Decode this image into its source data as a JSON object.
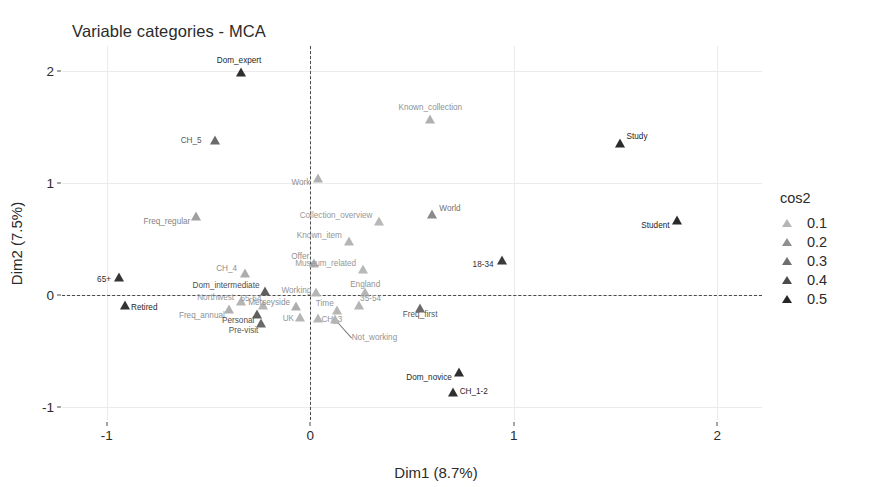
{
  "chart_data": {
    "type": "scatter",
    "title": "Variable categories - MCA",
    "xlabel": "Dim1 (8.7%)",
    "ylabel": "Dim2 (7.5%)",
    "xlim": [
      -1.22,
      2.22
    ],
    "ylim": [
      -1.12,
      2.22
    ],
    "xticks": [
      -1,
      0,
      1,
      2
    ],
    "xtick_labels": [
      "-1",
      "0",
      "1",
      "2"
    ],
    "yticks": [
      -1,
      0,
      1,
      2
    ],
    "ytick_labels": [
      "-1",
      "0",
      "1",
      "2"
    ],
    "grid": true,
    "reference_lines": {
      "x": 0,
      "y": 0,
      "style": "dashed"
    },
    "legend": {
      "title": "cos2",
      "position": "right",
      "entries": [
        {
          "label": "0.1",
          "color": "#b5b5b5"
        },
        {
          "label": "0.2",
          "color": "#909090"
        },
        {
          "label": "0.3",
          "color": "#6e6e6e"
        },
        {
          "label": "0.4",
          "color": "#4b4b4b"
        },
        {
          "label": "0.5",
          "color": "#262626"
        }
      ]
    },
    "color_variable": "cos2",
    "points": [
      {
        "label": "Dom_expert",
        "x": -0.34,
        "y": 1.99,
        "cos2": 0.46,
        "color": "#2f2f2f",
        "lx": -2,
        "ly": -11,
        "anchor": "middle"
      },
      {
        "label": "Known_collection",
        "x": 0.59,
        "y": 1.57,
        "cos2": 0.13,
        "color": "#b0b0b0",
        "lx": 0,
        "ly": -11,
        "anchor": "middle"
      },
      {
        "label": "CH_5",
        "x": -0.47,
        "y": 1.38,
        "cos2": 0.3,
        "color": "#6a6a6a",
        "lx": -13,
        "ly": 1,
        "anchor": "end"
      },
      {
        "label": "Study",
        "x": 1.52,
        "y": 1.35,
        "cos2": 0.47,
        "color": "#2b2b2b",
        "lx": 7,
        "ly": -6,
        "anchor": "start"
      },
      {
        "label": "Work",
        "x": 0.04,
        "y": 1.04,
        "cos2": 0.13,
        "color": "#b0b0b0",
        "lx": -8,
        "ly": 5,
        "anchor": "end"
      },
      {
        "label": "Freq_regular",
        "x": -0.56,
        "y": 0.7,
        "cos2": 0.17,
        "color": "#a0a0a0",
        "lx": -6,
        "ly": 6,
        "anchor": "end"
      },
      {
        "label": "World",
        "x": 0.6,
        "y": 0.72,
        "cos2": 0.22,
        "color": "#8a8a8a",
        "lx": 7,
        "ly": -5,
        "anchor": "start"
      },
      {
        "label": "Collection_overview",
        "x": 0.34,
        "y": 0.66,
        "cos2": 0.11,
        "color": "#b8b8b8",
        "lx": -7,
        "ly": -5,
        "anchor": "end"
      },
      {
        "label": "Student",
        "x": 1.8,
        "y": 0.67,
        "cos2": 0.48,
        "color": "#2b2b2b",
        "lx": -7,
        "ly": 6,
        "anchor": "end"
      },
      {
        "label": "Known_item",
        "x": 0.19,
        "y": 0.48,
        "cos2": 0.12,
        "color": "#b5b5b5",
        "lx": -7,
        "ly": -5,
        "anchor": "end"
      },
      {
        "label": "18-34",
        "x": 0.94,
        "y": 0.31,
        "cos2": 0.41,
        "color": "#3a3a3a",
        "lx": -8,
        "ly": 5,
        "anchor": "end"
      },
      {
        "label": "Offer",
        "x": 0.02,
        "y": 0.28,
        "cos2": 0.13,
        "color": "#b0b0b0",
        "lx": -5,
        "ly": -6,
        "anchor": "end"
      },
      {
        "label": "Museum_related",
        "x": 0.26,
        "y": 0.23,
        "cos2": 0.11,
        "color": "#b8b8b8",
        "lx": -7,
        "ly": -5,
        "anchor": "end"
      },
      {
        "label": "CH_4",
        "x": -0.32,
        "y": 0.19,
        "cos2": 0.14,
        "color": "#adadad",
        "lx": -8,
        "ly": -4,
        "anchor": "end"
      },
      {
        "label": "65+",
        "x": -0.94,
        "y": 0.16,
        "cos2": 0.43,
        "color": "#353535",
        "lx": -8,
        "ly": 3,
        "anchor": "end"
      },
      {
        "label": "Dom_intermediate",
        "x": -0.22,
        "y": 0.03,
        "cos2": 0.33,
        "color": "#5f5f5f",
        "lx": -6,
        "ly": -5,
        "anchor": "end"
      },
      {
        "label": "Working",
        "x": 0.03,
        "y": 0.02,
        "cos2": 0.12,
        "color": "#b5b5b5",
        "lx": -5,
        "ly": -1,
        "anchor": "end"
      },
      {
        "label": "England",
        "x": 0.27,
        "y": 0.02,
        "cos2": 0.12,
        "color": "#b5b5b5",
        "lx": 0,
        "ly": -7,
        "anchor": "middle"
      },
      {
        "label": "Northwest",
        "x": -0.34,
        "y": -0.06,
        "cos2": 0.12,
        "color": "#b5b5b5",
        "lx": -7,
        "ly": -3,
        "anchor": "end"
      },
      {
        "label": "Retired",
        "x": -0.91,
        "y": -0.09,
        "cos2": 0.43,
        "color": "#333333",
        "lx": 6,
        "ly": 3,
        "anchor": "start"
      },
      {
        "label": "55-64",
        "x": -0.23,
        "y": -0.09,
        "cos2": 0.12,
        "color": "#b5b5b5",
        "lx": -2,
        "ly": -6,
        "anchor": "end"
      },
      {
        "label": "35-54",
        "x": 0.24,
        "y": -0.09,
        "cos2": 0.12,
        "color": "#b5b5b5",
        "lx": 1,
        "ly": -6,
        "anchor": "start"
      },
      {
        "label": "Merseyside",
        "x": -0.07,
        "y": -0.1,
        "cos2": 0.14,
        "color": "#adadad",
        "lx": -6,
        "ly": -3,
        "anchor": "end"
      },
      {
        "label": "Freq_annual",
        "x": -0.4,
        "y": -0.13,
        "cos2": 0.13,
        "color": "#b0b0b0",
        "lx": -4,
        "ly": 7,
        "anchor": "end"
      },
      {
        "label": "Freq_first",
        "x": 0.54,
        "y": -0.12,
        "cos2": 0.3,
        "color": "#6a6a6a",
        "lx": 0,
        "ly": 7,
        "anchor": "middle"
      },
      {
        "label": "Time",
        "x": 0.13,
        "y": -0.14,
        "cos2": 0.12,
        "color": "#b5b5b5",
        "lx": -3,
        "ly": -6,
        "anchor": "end"
      },
      {
        "label": "Personal",
        "x": -0.26,
        "y": -0.17,
        "cos2": 0.32,
        "color": "#5f5f5f",
        "lx": -3,
        "ly": 7,
        "anchor": "end"
      },
      {
        "label": "UK",
        "x": -0.05,
        "y": -0.2,
        "cos2": 0.12,
        "color": "#b5b5b5",
        "lx": -6,
        "ly": 2,
        "anchor": "end"
      },
      {
        "label": "CH_3",
        "x": 0.04,
        "y": -0.21,
        "cos2": 0.12,
        "color": "#b5b5b5",
        "lx": 3,
        "ly": 2,
        "anchor": "start"
      },
      {
        "label": "Pre-visit",
        "x": -0.24,
        "y": -0.25,
        "cos2": 0.3,
        "color": "#6a6a6a",
        "lx": -3,
        "ly": 8,
        "anchor": "end"
      },
      {
        "label": "Not_working",
        "x": 0.12,
        "y": -0.22,
        "cos2": 0.12,
        "color": "#b5b5b5",
        "lx": 17,
        "ly": 19,
        "anchor": "start",
        "leader": true
      },
      {
        "label": "Dom_novice",
        "x": 0.73,
        "y": -0.69,
        "cos2": 0.45,
        "color": "#2f2f2f",
        "lx": -7,
        "ly": 6,
        "anchor": "end"
      },
      {
        "label": "CH_1-2",
        "x": 0.7,
        "y": -0.87,
        "cos2": 0.44,
        "color": "#303030",
        "lx": 7,
        "ly": 0,
        "anchor": "start"
      }
    ]
  }
}
